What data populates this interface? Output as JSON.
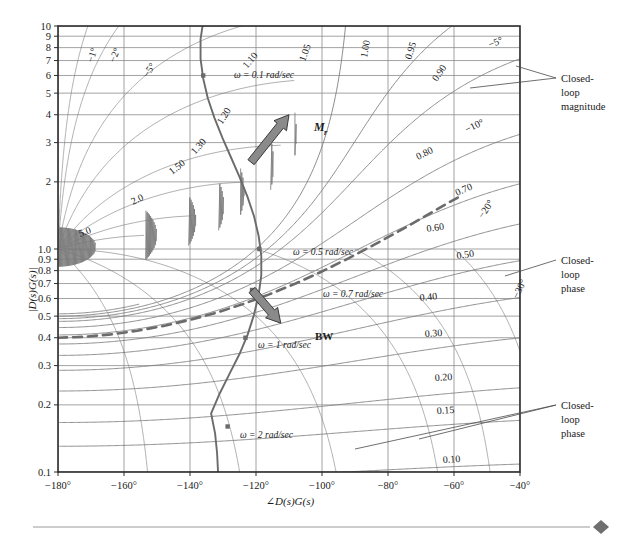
{
  "chart_data": {
    "type": "line",
    "title": "",
    "xlabel": "∠D(s)G(s)",
    "ylabel": "|D(s)G(s)|",
    "xlim": [
      -180,
      -40
    ],
    "ylim": [
      0.1,
      10
    ],
    "yscale": "log",
    "grid": true,
    "xticks": [
      "−180°",
      "−160°",
      "−140°",
      "−120°",
      "−100°",
      "−80°",
      "−60°",
      "−40°"
    ],
    "xtick_values": [
      -180,
      -160,
      -140,
      -120,
      -100,
      -80,
      -60,
      -40
    ],
    "yticks": [
      "10",
      "9",
      "8",
      "7",
      "6",
      "5",
      "4",
      "3",
      "2",
      "1.0",
      "0.9",
      "0.8",
      "0.7",
      "0.6",
      "0.5",
      "0.4",
      "0.3",
      "0.2",
      "0.1"
    ],
    "ytick_values": [
      10,
      9,
      8,
      7,
      6,
      5,
      4,
      3,
      2,
      1.0,
      0.9,
      0.8,
      0.7,
      0.6,
      0.5,
      0.4,
      0.3,
      0.2,
      0.1
    ],
    "closed_loop_magnitude_contours": [
      "5.0",
      "2.0",
      "1.50",
      "1.30",
      "1.20",
      "1.10",
      "1.05",
      "1.00",
      "0.95",
      "0.90",
      "0.80",
      "0.70",
      "0.60",
      "0.50",
      "0.40",
      "0.30",
      "0.20",
      "0.15",
      "0.10"
    ],
    "closed_loop_phase_contours": [
      "−1°",
      "−2°",
      "−5°",
      "−5°",
      "−10°",
      "−20°",
      "−30°"
    ],
    "series": [
      {
        "name": "open-loop frequency response",
        "style": "solid",
        "points": [
          [
            -131.5,
            0.1
          ],
          [
            -131.8,
            0.122
          ],
          [
            -132.4,
            0.149
          ],
          [
            -133.6,
            0.183
          ],
          [
            -131.0,
            0.225
          ],
          [
            -128.0,
            0.276
          ],
          [
            -125.0,
            0.338
          ],
          [
            -122.5,
            0.414
          ],
          [
            -120.6,
            0.508
          ],
          [
            -119.2,
            0.622
          ],
          [
            -118.4,
            0.762
          ],
          [
            -118.4,
            0.934
          ],
          [
            -119.2,
            1.144
          ],
          [
            -120.6,
            1.402
          ],
          [
            -122.6,
            1.718
          ],
          [
            -125.0,
            2.105
          ],
          [
            -127.6,
            2.579
          ],
          [
            -130.2,
            3.16
          ],
          [
            -132.6,
            3.873
          ],
          [
            -134.6,
            4.746
          ],
          [
            -136.0,
            5.816
          ],
          [
            -136.8,
            7.127
          ],
          [
            -136.8,
            8.734
          ],
          [
            -136.2,
            10.0
          ]
        ]
      },
      {
        "name": "closed-loop magnitude 0.70 locus (bandwidth)",
        "style": "dashed",
        "points": [
          [
            -180,
            0.4
          ],
          [
            -172,
            0.404
          ],
          [
            -164,
            0.414
          ],
          [
            -156,
            0.43
          ],
          [
            -148,
            0.452
          ],
          [
            -140,
            0.481
          ],
          [
            -132,
            0.518
          ],
          [
            -124,
            0.566
          ],
          [
            -116,
            0.626
          ],
          [
            -108,
            0.7
          ],
          [
            -100,
            0.793
          ],
          [
            -92,
            0.908
          ],
          [
            -84,
            1.048
          ],
          [
            -76,
            1.218
          ],
          [
            -70,
            1.37
          ],
          [
            -64,
            1.54
          ],
          [
            -58,
            1.73
          ]
        ]
      }
    ],
    "markers": [
      {
        "label": "ω = 0.1 rad/sec",
        "x": -136.0,
        "y": 6.0
      },
      {
        "label": "ω = 0.5 rad/sec",
        "x": -119.0,
        "y": 1.0
      },
      {
        "label": "ω = 0.7 rad/sec",
        "x": -121.2,
        "y": 0.655
      },
      {
        "label": "ω = 1 rad/sec",
        "x": -123.2,
        "y": 0.4
      },
      {
        "label": "ω = 2 rad/sec",
        "x": -128.6,
        "y": 0.16
      }
    ],
    "annotations": [
      {
        "label": "M",
        "sub": "r",
        "kind": "arrow",
        "tip_x": -110.0,
        "tip_y": 4.0,
        "tail_x": -121.5,
        "tail_y": 2.45
      },
      {
        "label": "BW",
        "sub": "",
        "kind": "arrow",
        "tip_x": -112.5,
        "tip_y": 0.465,
        "tail_x": -121.2,
        "tail_y": 0.655
      }
    ],
    "callouts": [
      {
        "lines": [
          "Closed-",
          "loop",
          "magnitude"
        ],
        "name": "closed-loop-magnitude-callout"
      },
      {
        "lines": [
          "Closed-",
          "loop",
          "phase"
        ],
        "name": "closed-loop-phase-callout-upper"
      },
      {
        "lines": [
          "Closed-",
          "loop",
          "phase"
        ],
        "name": "closed-loop-phase-callout-lower"
      }
    ]
  },
  "colors": {
    "curve": "#6b6b6b",
    "grid": "#8c8c8c",
    "contour": "#7a7a7a",
    "frame": "#2b2b2b",
    "text": "#1a1a1a",
    "arrow_fill": "#8a8a8a",
    "arrow_stroke": "#3a3a3a",
    "footer_rule": "#9a9a9a",
    "footer_diamond": "#6f6f6f"
  },
  "labels": {
    "mag_1_05": "1.05",
    "mag_1_00": "1.00",
    "mag_0_95": "0.95",
    "mag_0_90": "0.90",
    "mag_0_80": "0.80",
    "mag_0_70": "0.70",
    "mag_0_60": "0.60",
    "mag_0_50": "0.50",
    "mag_0_40": "0.40",
    "mag_0_30": "0.30",
    "mag_0_20": "0.20",
    "mag_0_15": "0.15",
    "mag_0_10": "0.10",
    "mag_1_10": "1.10",
    "mag_1_20": "1.20",
    "mag_1_30": "1.30",
    "mag_1_50": "1.50",
    "mag_2_0": "2.0",
    "mag_5_0": "5.0",
    "ph_m1": "−1°",
    "ph_m2": "−2°",
    "ph_m5a": "−5°",
    "ph_m5b": "−5°",
    "ph_m10": "−10°",
    "ph_m20": "−20°",
    "ph_m30": "−30°",
    "callout_closed": "Closed-",
    "callout_loop": "loop",
    "callout_magnitude": "magnitude",
    "callout_phase": "phase",
    "mr": "M",
    "mr_sub": "r",
    "bw": "BW",
    "w01": "ω = 0.1 rad/sec",
    "w05": "ω = 0.5 rad/sec",
    "w07": "ω = 0.7 rad/sec",
    "w1": "ω = 1 rad/sec",
    "w2": "ω = 2 rad/sec",
    "xaxis_title": "∠D(s)G(s)",
    "yaxis_title": "|D(s)G(s)|",
    "t10": "10",
    "t9": "9",
    "t8": "8",
    "t7": "7",
    "t6": "6",
    "t5": "5",
    "t4": "4",
    "t3": "3",
    "t2": "2",
    "t1": "1.0",
    "t09": "0.9",
    "t08": "0.8",
    "t07": "0.7",
    "t06": "0.6",
    "t05": "0.5",
    "t04": "0.4",
    "t03": "0.3",
    "t02": "0.2",
    "t01": "0.1",
    "x180": "−180°",
    "x160": "−160°",
    "x140": "−140°",
    "x120": "−120°",
    "x100": "−100°",
    "x80": "−80°",
    "x60": "−60°",
    "x40": "−40°"
  }
}
